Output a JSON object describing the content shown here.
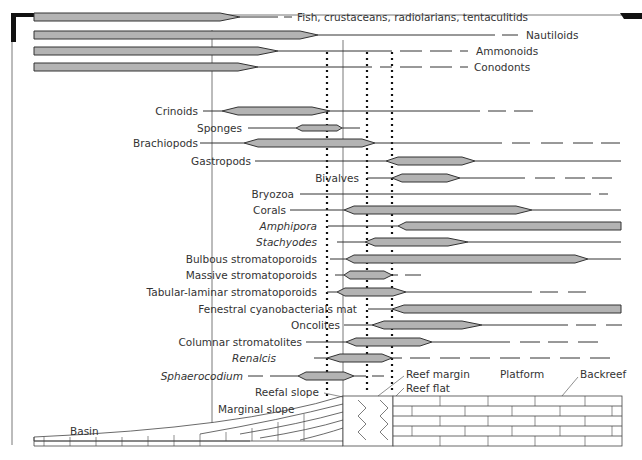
{
  "figure": {
    "type": "reef facies fossil distribution diagram",
    "taxa": [
      {
        "label": "Fish, crustaceans, radiolarians, tentaculitids",
        "italic": false,
        "y": 17
      },
      {
        "label": "Nautiloids",
        "italic": false,
        "y": 35
      },
      {
        "label": "Ammonoids",
        "italic": false,
        "y": 51
      },
      {
        "label": "Conodonts",
        "italic": false,
        "y": 67
      },
      {
        "label": "Crinoids",
        "italic": false,
        "y": 111
      },
      {
        "label": "Sponges",
        "italic": false,
        "y": 128
      },
      {
        "label": "Brachiopods",
        "italic": false,
        "y": 143
      },
      {
        "label": "Gastropods",
        "italic": false,
        "y": 161
      },
      {
        "label": "Bivalves",
        "italic": false,
        "y": 178
      },
      {
        "label": "Bryozoa",
        "italic": false,
        "y": 194
      },
      {
        "label": "Corals",
        "italic": false,
        "y": 210
      },
      {
        "label": "Amphipora",
        "italic": true,
        "y": 226
      },
      {
        "label": "Stachyodes",
        "italic": true,
        "y": 242
      },
      {
        "label": "Bulbous stromatoporoids",
        "italic": false,
        "y": 259
      },
      {
        "label": "Massive stromatoporoids",
        "italic": false,
        "y": 275
      },
      {
        "label": "Tabular-laminar stromatoporoids",
        "italic": false,
        "y": 292
      },
      {
        "label": "Fenestral cyanobacterials mat",
        "italic": false,
        "y": 309
      },
      {
        "label": "Oncolites",
        "italic": false,
        "y": 325
      },
      {
        "label": "Columnar stromatolites",
        "italic": false,
        "y": 342
      },
      {
        "label": "Renalcis",
        "italic": true,
        "y": 358
      },
      {
        "label": "Sphaerocodium",
        "italic": true,
        "y": 376
      }
    ],
    "environments": [
      {
        "label": "Basin"
      },
      {
        "label": "Marginal slope"
      },
      {
        "label": "Reefal slope"
      },
      {
        "label": "Reef margin"
      },
      {
        "label": "Reef flat"
      },
      {
        "label": "Platform"
      },
      {
        "label": "Backreef"
      }
    ],
    "colors": {
      "bar_fill": "#b3b3b3",
      "bar_stroke": "#333333",
      "line": "#333333",
      "background": "#ffffff"
    }
  }
}
